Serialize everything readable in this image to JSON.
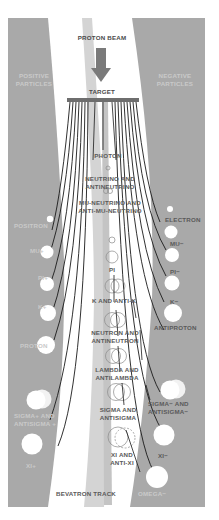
{
  "diagram": {
    "title": "PROTON BEAM",
    "target_label": "TARGET",
    "track_label": "BEVATRON TRACK",
    "colors": {
      "panel": "#a9a9a9",
      "track": "#d0d0d0",
      "arrow": "#7a7a7a",
      "line": "#1a1a1a",
      "text": "#555555",
      "background": "#ffffff"
    },
    "left_panel": {
      "heading_line1": "POSITIVE",
      "heading_line2": "PARTICLES",
      "particles": [
        {
          "label": "POSITRON"
        },
        {
          "label": "MU+"
        },
        {
          "label": "PI+"
        },
        {
          "label": "K+"
        },
        {
          "label": "PROTON"
        },
        {
          "label_line1": "SIGMA+ AND",
          "label_line2": "ANTISIGMA +"
        },
        {
          "label": "XI+"
        }
      ]
    },
    "right_panel": {
      "heading_line1": "NEGATIVE",
      "heading_line2": "PARTICLES",
      "particles": [
        {
          "label": "ELECTRON"
        },
        {
          "label": "MU−"
        },
        {
          "label": "PI−"
        },
        {
          "label": "K−"
        },
        {
          "label": "ANTIPROTON"
        },
        {
          "label_line1": "SIGMA− AND",
          "label_line2": "ANTISIGMA−"
        },
        {
          "label": "XI−"
        },
        {
          "label": "OMEGA−"
        }
      ]
    },
    "center_particles": [
      {
        "label_line1": "PHOTON"
      },
      {
        "label_line1": "NEUTRINO AND",
        "label_line2": "ANTINEUTRINO"
      },
      {
        "label_line1": "MU-NEUTRINO AND",
        "label_line2": "ANTI-MU-NEUTRINO"
      },
      {
        "label_line1": "PI"
      },
      {
        "label_line1": "K AND ANTI-K"
      },
      {
        "label_line1": "NEUTRON AND",
        "label_line2": "ANTINEUTRON"
      },
      {
        "label_line1": "LAMBDA AND",
        "label_line2": "ANTILAMBDA"
      },
      {
        "label_line1": "SIGMA AND",
        "label_line2": "ANTISIGMA"
      },
      {
        "label_line1": "XI AND",
        "label_line2": "ANTI-XI"
      }
    ]
  }
}
